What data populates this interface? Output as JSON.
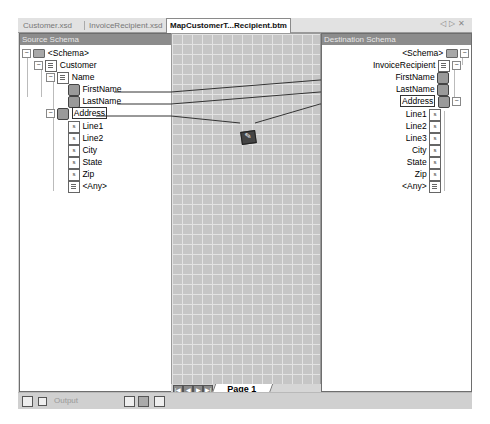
{
  "tabs": [
    {
      "label": "Customer.xsd",
      "active": false
    },
    {
      "label": "InvoiceRecipient.xsd",
      "active": false
    },
    {
      "label": "MapCustomerT...Recipient.btm",
      "active": true
    }
  ],
  "tab_controls": {
    "prev": "◁",
    "next": "▷",
    "close": "✕"
  },
  "source_schema": {
    "title": "Source Schema",
    "nodes": [
      {
        "label": "<Schema>",
        "icon": "schema-folder-icon"
      },
      {
        "label": "Customer",
        "icon": "record-doc-icon"
      },
      {
        "label": "Name",
        "icon": "record-doc-icon"
      },
      {
        "label": "FirstName",
        "icon": "field-element-icon"
      },
      {
        "label": "LastName",
        "icon": "field-element-icon"
      },
      {
        "label": "Address",
        "icon": "field-element-icon"
      },
      {
        "label": "Line1",
        "icon": "field-attribute-icon"
      },
      {
        "label": "Line2",
        "icon": "field-attribute-icon"
      },
      {
        "label": "City",
        "icon": "field-attribute-icon"
      },
      {
        "label": "State",
        "icon": "field-attribute-icon"
      },
      {
        "label": "Zip",
        "icon": "field-attribute-icon"
      },
      {
        "label": "<Any>",
        "icon": "any-doc-icon"
      }
    ]
  },
  "destination_schema": {
    "title": "Destination Schema",
    "nodes": [
      {
        "label": "<Schema>",
        "icon": "schema-folder-icon"
      },
      {
        "label": "InvoiceRecipient",
        "icon": "record-doc-icon"
      },
      {
        "label": "FirstName",
        "icon": "field-element-icon"
      },
      {
        "label": "LastName",
        "icon": "field-element-icon"
      },
      {
        "label": "Address",
        "icon": "field-element-icon"
      },
      {
        "label": "Line1",
        "icon": "field-attribute-icon"
      },
      {
        "label": "Line2",
        "icon": "field-attribute-icon"
      },
      {
        "label": "Line3",
        "icon": "field-attribute-icon"
      },
      {
        "label": "City",
        "icon": "field-attribute-icon"
      },
      {
        "label": "State",
        "icon": "field-attribute-icon"
      },
      {
        "label": "Zip",
        "icon": "field-attribute-icon"
      },
      {
        "label": "<Any>",
        "icon": "any-doc-icon"
      }
    ]
  },
  "grid": {
    "functoid": "scripting-functoid-icon"
  },
  "page_nav": {
    "first": "|◀",
    "prev": "◀",
    "next": "▶",
    "last": "▶|",
    "page_label": "Page 1"
  },
  "statusbar": {
    "output_label": "Output"
  }
}
